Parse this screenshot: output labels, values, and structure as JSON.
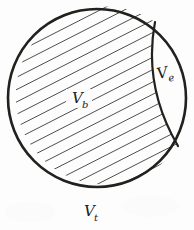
{
  "figure": {
    "type": "hand-drawn geometric volume diagram",
    "background_color": "#fdfdfd",
    "ink_color": "#20201f",
    "hatch_color": "#3a3a38"
  },
  "labels": {
    "bulk": {
      "symbol": "V",
      "subscript": "b",
      "x": 72,
      "y": 103,
      "region": "hatched-interior"
    },
    "excluded": {
      "symbol": "V",
      "subscript": "e",
      "x": 163,
      "y": 78,
      "region": "crescent"
    },
    "total": {
      "symbol": "V",
      "subscript": "t",
      "x": 88,
      "y": 216,
      "region": "outside-below-circle"
    }
  },
  "geometry": {
    "circle": {
      "cx": 97,
      "cy": 98,
      "r": 89,
      "stroke_width": 2.6
    },
    "chord": {
      "start_x": 155,
      "start_y": 22,
      "end_x": 178,
      "end_y": 146,
      "control_x": 143,
      "control_y": 86,
      "stroke_width": 2.2
    },
    "hatching": {
      "angle_degrees": 27,
      "spacing_px": 11,
      "stroke_width": 0.9,
      "count": 26
    }
  }
}
